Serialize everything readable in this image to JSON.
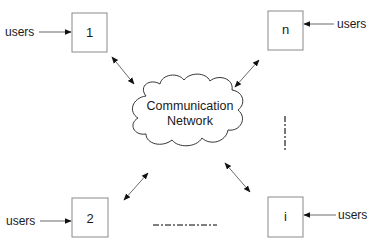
{
  "diagram": {
    "network": {
      "label_line1": "Communication",
      "label_line2": "Network"
    },
    "nodes": [
      {
        "id": "1",
        "label": "1",
        "input_label": "users"
      },
      {
        "id": "n",
        "label": "n",
        "input_label": "users"
      },
      {
        "id": "2",
        "label": "2",
        "input_label": "users"
      },
      {
        "id": "i",
        "label": "i",
        "input_label": "users"
      }
    ],
    "ellipsis_indicators": [
      "horizontal dash-dot (between 2 and i)",
      "vertical dash-dot (between n and i)"
    ],
    "connections": [
      {
        "from": "1",
        "to": "network",
        "type": "bidirectional"
      },
      {
        "from": "n",
        "to": "network",
        "type": "bidirectional"
      },
      {
        "from": "2",
        "to": "network",
        "type": "bidirectional"
      },
      {
        "from": "i",
        "to": "network",
        "type": "bidirectional"
      }
    ],
    "colors": {
      "box_stroke": "#8a8a8a",
      "line": "#6a6a6a",
      "text": "#1a1a1a"
    }
  }
}
